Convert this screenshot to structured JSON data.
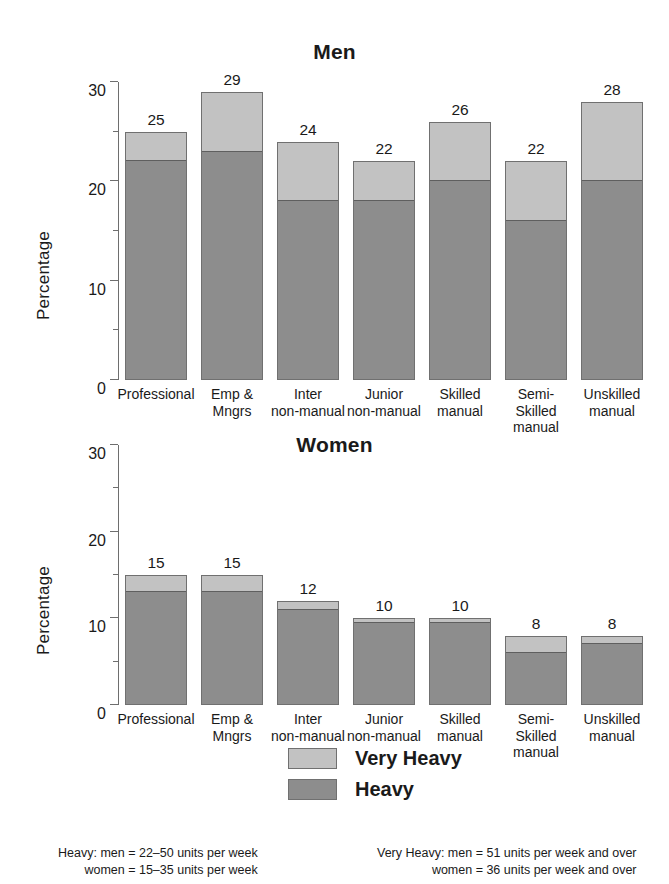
{
  "chart_data": [
    {
      "type": "bar",
      "title": "Men",
      "xlabel": "",
      "ylabel": "Percentage",
      "ylim": [
        0,
        30
      ],
      "yticks_major": [
        0,
        10,
        20,
        30
      ],
      "yticks_minor": [
        5,
        15,
        25
      ],
      "grid": false,
      "stacked": true,
      "legend_position": "bottom-center",
      "categories": [
        "Professional",
        "Emp &\nMngrs",
        "Inter\nnon-manual",
        "Junior\nnon-manual",
        "Skilled\nmanual",
        "Semi-\nSkilled\nmanual",
        "Unskilled\nmanual"
      ],
      "series": [
        {
          "name": "Heavy",
          "values": [
            22,
            23,
            18,
            18,
            20,
            16,
            20
          ]
        },
        {
          "name": "Very Heavy",
          "values": [
            3,
            6,
            6,
            4,
            6,
            6,
            8
          ]
        }
      ],
      "totals": [
        25,
        29,
        24,
        22,
        26,
        22,
        28
      ],
      "total_labels": [
        "25",
        "29",
        "24",
        "22",
        "26",
        "22",
        "28"
      ]
    },
    {
      "type": "bar",
      "title": "Women",
      "xlabel": "",
      "ylabel": "Percentage",
      "ylim": [
        0,
        30
      ],
      "yticks_major": [
        0,
        10,
        20,
        30
      ],
      "yticks_minor": [
        5,
        15,
        25
      ],
      "grid": false,
      "stacked": true,
      "legend_position": "bottom-center",
      "categories": [
        "Professional",
        "Emp &\nMngrs",
        "Inter\nnon-manual",
        "Junior\nnon-manual",
        "Skilled\nmanual",
        "Semi-\nSkilled\nmanual",
        "Unskilled\nmanual"
      ],
      "series": [
        {
          "name": "Heavy",
          "values": [
            13,
            13,
            11,
            9.5,
            9.5,
            6,
            7
          ]
        },
        {
          "name": "Very Heavy",
          "values": [
            2,
            2,
            1,
            0.5,
            0.5,
            2,
            1
          ]
        }
      ],
      "totals": [
        15,
        15,
        12,
        10,
        10,
        8,
        8
      ],
      "total_labels": [
        "15",
        "15",
        "12",
        "10",
        "10",
        "8",
        "8"
      ]
    }
  ],
  "men": {
    "title": "Men",
    "ylabel": "Percentage",
    "ytick_labels": [
      "0",
      "10",
      "20",
      "30"
    ]
  },
  "women": {
    "title": "Women",
    "ylabel": "Percentage",
    "ytick_labels": [
      "0",
      "10",
      "20",
      "30"
    ]
  },
  "legend": {
    "very_heavy": "Very Heavy",
    "heavy": "Heavy"
  },
  "footnotes": {
    "heavy_line1": "Heavy: men = 22–50 units per week",
    "heavy_line2": "women = 15–35 units per week",
    "very_heavy_line1": "Very Heavy: men = 51 units per week and over",
    "very_heavy_line2": "women = 36 units per week and over"
  },
  "colors": {
    "heavy": "#8d8d8d",
    "very_heavy": "#c2c2c2",
    "axis": "#6e6e6e",
    "text": "#1a1a1a",
    "background": "#ffffff"
  }
}
